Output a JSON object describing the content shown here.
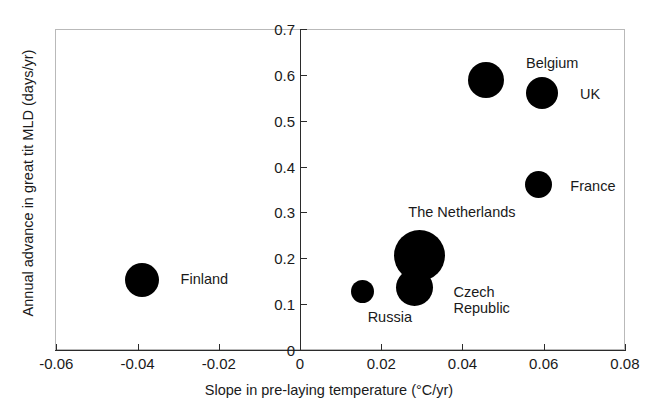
{
  "chart_data": {
    "type": "scatter",
    "title": "",
    "xlabel": "Slope in pre-laying temperature (°C/yr)",
    "ylabel": "Annual advance in great tit MLD (days/yr)",
    "xlim": [
      -0.06,
      0.08
    ],
    "ylim": [
      0,
      0.7
    ],
    "xticks": [
      "-0.06",
      "-0.04",
      "-0.02",
      "0",
      "0.02",
      "0.04",
      "0.06",
      "0.08"
    ],
    "xtick_values": [
      -0.06,
      -0.04,
      -0.02,
      0,
      0.02,
      0.04,
      0.06,
      0.08
    ],
    "yticks": [
      "0",
      "0.1",
      "0.2",
      "0.3",
      "0.4",
      "0.5",
      "0.6",
      "0.7"
    ],
    "ytick_values": [
      0,
      0.1,
      0.2,
      0.3,
      0.4,
      0.5,
      0.6,
      0.7
    ],
    "grid": false,
    "legend": "none",
    "marker_color": "#000000",
    "marker_shape": "circle",
    "size_encoding": "bubble area proportional to study sample size",
    "points": [
      {
        "label": "Finland",
        "x": -0.039,
        "y": 0.153,
        "radius_px": 17.0,
        "label_dx": 22,
        "label_dy": 0
      },
      {
        "label": "Russia",
        "x": 0.0153,
        "y": 0.127,
        "radius_px": 11.5,
        "label_dx": -6,
        "label_dy": 26
      },
      {
        "label": "Czech Republic",
        "x": 0.0283,
        "y": 0.137,
        "radius_px": 18.5,
        "label_dx": 20,
        "label_dy": 6
      },
      {
        "label": "The Netherlands",
        "x": 0.0295,
        "y": 0.207,
        "radius_px": 25.5,
        "label_dx": -37,
        "label_dy": -42
      },
      {
        "label": "Belgium",
        "x": 0.0458,
        "y": 0.589,
        "radius_px": 18.0,
        "label_dx": 22,
        "label_dy": -16
      },
      {
        "label": "UK",
        "x": 0.0596,
        "y": 0.56,
        "radius_px": 16.0,
        "label_dx": 22,
        "label_dy": 2
      },
      {
        "label": "France",
        "x": 0.0588,
        "y": 0.36,
        "radius_px": 13.5,
        "label_dx": 18,
        "label_dy": 2
      }
    ]
  }
}
